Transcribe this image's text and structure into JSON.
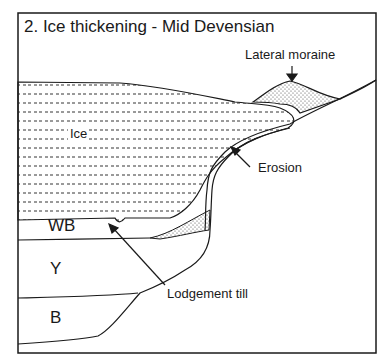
{
  "diagram": {
    "title": "2.  Ice thickening - Mid Devensian",
    "labels": {
      "lateral_moraine": "Lateral moraine",
      "ice": "Ice",
      "erosion": "Erosion",
      "lodgement_till": "Lodgement till",
      "wb": "WB",
      "y": "Y",
      "b": "B"
    },
    "colors": {
      "line": "#1a1a1a",
      "background": "#ffffff",
      "ice_dash": "#333333",
      "stipple": "#444444"
    }
  }
}
